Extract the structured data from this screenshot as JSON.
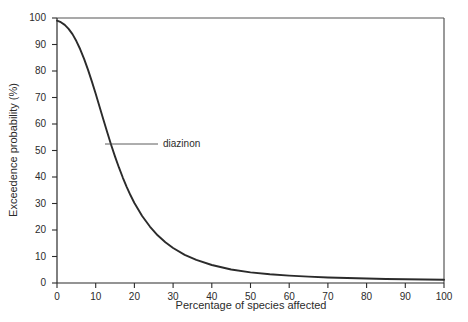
{
  "chart_data": {
    "type": "line",
    "title": "",
    "subtitle": "",
    "xlabel": "Percentage of species affected",
    "ylabel": "Exceedence probability (%)",
    "xlim": [
      0,
      100
    ],
    "ylim": [
      0,
      100
    ],
    "grid": false,
    "legend_position": "none",
    "xticks": [
      0,
      10,
      20,
      30,
      40,
      50,
      60,
      70,
      80,
      90,
      100
    ],
    "xtick_labels": [
      "0",
      "10",
      "20",
      "30",
      "40",
      "50",
      "60",
      "70",
      "80",
      "90",
      "100"
    ],
    "yticks": [
      0,
      10,
      20,
      30,
      40,
      50,
      60,
      70,
      80,
      90,
      100
    ],
    "ytick_labels": [
      "0",
      "10",
      "20",
      "30",
      "40",
      "50",
      "60",
      "70",
      "80",
      "90",
      "100"
    ],
    "annotations": [
      {
        "text": "diazinon",
        "x": 12.3,
        "y": 52.5,
        "leader_line": true
      }
    ],
    "series": [
      {
        "name": "diazinon",
        "color": "#2b2b2b",
        "x": [
          0,
          1,
          2,
          3,
          4,
          5,
          6,
          7,
          8,
          9,
          10,
          11,
          12,
          13,
          14,
          15,
          16,
          17,
          18,
          19,
          20,
          22,
          24,
          26,
          28,
          30,
          33,
          36,
          40,
          45,
          50,
          55,
          60,
          65,
          70,
          75,
          80,
          85,
          90,
          95,
          100
        ],
        "values": [
          99.0,
          98.4,
          97.4,
          95.9,
          93.9,
          91.3,
          88.2,
          84.6,
          80.5,
          76.1,
          71.4,
          66.5,
          61.6,
          56.8,
          52.1,
          47.7,
          43.6,
          39.8,
          36.3,
          33.1,
          30.2,
          25.3,
          21.3,
          18.0,
          15.4,
          13.2,
          10.6,
          8.7,
          6.8,
          5.1,
          4.0,
          3.3,
          2.8,
          2.4,
          2.1,
          1.9,
          1.7,
          1.5,
          1.4,
          1.3,
          1.2
        ]
      }
    ]
  },
  "annotation_label": "diazinon"
}
